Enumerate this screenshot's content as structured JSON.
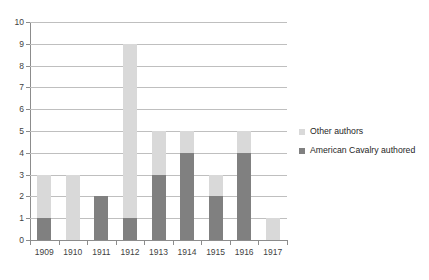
{
  "chart_data": {
    "type": "bar",
    "subtype": "stacked-vertical-bar",
    "title": "",
    "subtitle": "",
    "xlabel": "",
    "ylabel": "",
    "categories": [
      "1909",
      "1910",
      "1911",
      "1912",
      "1913",
      "1914",
      "1915",
      "1916",
      "1917"
    ],
    "series": [
      {
        "name": "American Cavalry authored",
        "color": "#808080",
        "values": [
          1,
          0,
          2,
          1,
          3,
          4,
          2,
          4,
          0
        ]
      },
      {
        "name": "Other authors",
        "color": "#d9d9d9",
        "values": [
          2,
          3,
          0,
          8,
          2,
          1,
          1,
          1,
          1
        ]
      }
    ],
    "totals": [
      3,
      3,
      2,
      9,
      5,
      5,
      3,
      5,
      1
    ],
    "ylim": [
      0,
      10
    ],
    "yticks": [
      "0",
      "1",
      "2",
      "3",
      "4",
      "5",
      "6",
      "7",
      "8",
      "9",
      "10"
    ],
    "xticks": [
      "1909",
      "1910",
      "1911",
      "1912",
      "1913",
      "1914",
      "1915",
      "1916",
      "1917"
    ],
    "grid": "horizontal",
    "legend_position": "right",
    "legend_order": [
      "Other authors",
      "American Cavalry authored"
    ],
    "annotations": []
  },
  "legend": {
    "items": [
      {
        "label": "Other authors",
        "color": "#d9d9d9",
        "swatch_icon": "legend-swatch-light"
      },
      {
        "label": "American Cavalry authored",
        "color": "#808080",
        "swatch_icon": "legend-swatch-dark"
      }
    ]
  }
}
